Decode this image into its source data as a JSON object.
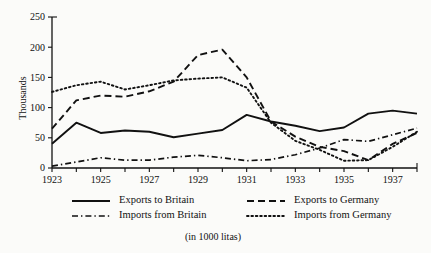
{
  "chart_data": {
    "type": "line",
    "title": "",
    "subtitle": "",
    "caption": "(in 1000 litas)",
    "xlabel": "",
    "ylabel": "Thousands",
    "xlim": [
      1923,
      1938
    ],
    "ylim": [
      0,
      250
    ],
    "grid": false,
    "legend_position": "bottom",
    "y_ticks": [
      0,
      50,
      100,
      150,
      200,
      250
    ],
    "y_tick_labels": [
      "0",
      "50",
      "100",
      "150",
      "200",
      "250"
    ],
    "x_ticks": [
      1923,
      1924,
      1925,
      1926,
      1927,
      1928,
      1929,
      1930,
      1931,
      1932,
      1933,
      1934,
      1935,
      1936,
      1937,
      1938
    ],
    "x_tick_labels": [
      "1923",
      "",
      "1925",
      "",
      "1927",
      "",
      "1929",
      "",
      "1931",
      "",
      "1933",
      "",
      "1935",
      "",
      "1937",
      ""
    ],
    "x": [
      1923,
      1924,
      1925,
      1926,
      1927,
      1928,
      1929,
      1930,
      1931,
      1932,
      1933,
      1934,
      1935,
      1936,
      1937,
      1938
    ],
    "series": [
      {
        "name": "Exports to Britain",
        "style": "solid",
        "values": [
          40,
          75,
          58,
          62,
          60,
          51,
          57,
          63,
          88,
          77,
          70,
          61,
          67,
          90,
          95,
          90
        ]
      },
      {
        "name": "Imports from Britain",
        "style": "dash-dot",
        "values": [
          3,
          10,
          17,
          13,
          13,
          18,
          21,
          17,
          12,
          14,
          22,
          33,
          47,
          44,
          55,
          66
        ]
      },
      {
        "name": "Exports to Germany",
        "style": "dashed",
        "values": [
          65,
          112,
          120,
          118,
          127,
          143,
          187,
          196,
          150,
          77,
          52,
          35,
          28,
          13,
          40,
          58
        ]
      },
      {
        "name": "Imports from Germany",
        "style": "dotted",
        "values": [
          126,
          137,
          143,
          130,
          137,
          145,
          148,
          150,
          133,
          75,
          45,
          30,
          12,
          13,
          35,
          60
        ]
      }
    ]
  },
  "legend": {
    "entries": [
      {
        "label": "Exports to Britain",
        "style": "solid"
      },
      {
        "label": "Exports to Germany",
        "style": "dashed"
      },
      {
        "label": "Imports from Britain",
        "style": "dash-dot"
      },
      {
        "label": "Imports from Germany",
        "style": "dotted"
      }
    ]
  },
  "colors": {
    "ink": "#111111",
    "background": "#fbfbf9"
  }
}
